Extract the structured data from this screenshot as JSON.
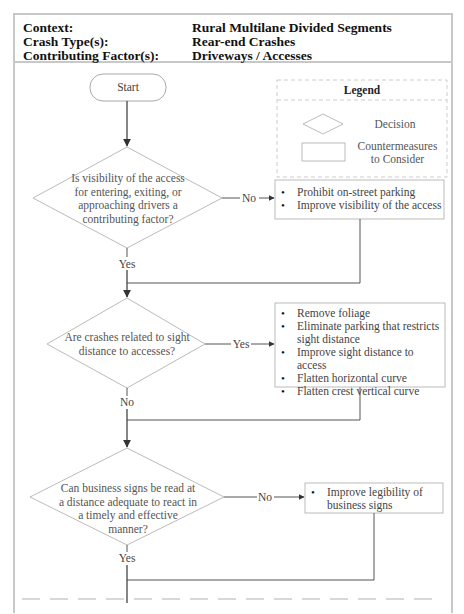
{
  "header": {
    "rows": [
      {
        "label": "Context:",
        "value": "Rural Multilane Divided Segments"
      },
      {
        "label": "Crash Type(s):",
        "value": "Rear-end Crashes"
      },
      {
        "label": "Contributing Factor(s):",
        "value": "Driveways / Accesses"
      }
    ]
  },
  "legend": {
    "title": "Legend",
    "decision_label": "Decision",
    "countermeasure_label_line1": "Countermeasures",
    "countermeasure_label_line2": "to Consider"
  },
  "flowchart": {
    "start_label": "Start",
    "decisions": [
      {
        "question": [
          "Is visibility of the access",
          "for entering, exiting, or",
          "approaching drivers a",
          "contributing factor?"
        ],
        "side_branch": "No",
        "down_branch": "Yes",
        "countermeasures": [
          "Prohibit on-street parking",
          "Improve visibility of the access"
        ]
      },
      {
        "question": [
          "Are crashes related to sight",
          "distance to accesses?"
        ],
        "side_branch": "Yes",
        "down_branch": "No",
        "countermeasures": [
          "Remove foliage",
          "Eliminate parking that restricts sight distance",
          "Improve sight distance to access",
          "Flatten horizontal curve",
          "Flatten crest vertical curve"
        ]
      },
      {
        "question": [
          "Can business signs be read at",
          "a distance adequate to react in",
          "a timely and effective",
          "manner?"
        ],
        "side_branch": "No",
        "down_branch": "Yes",
        "countermeasures": [
          "Improve legibility of business signs"
        ]
      }
    ]
  }
}
